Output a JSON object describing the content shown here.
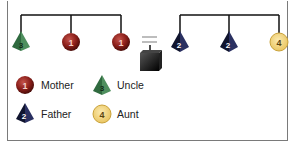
{
  "diagram": {
    "left_balance": {
      "items": [
        {
          "shape": "pyramid",
          "label": "3",
          "color": "#3f7a4e",
          "role": "Uncle"
        },
        {
          "shape": "sphere",
          "label": "1",
          "color": "#8b1f1a",
          "role": "Mother"
        },
        {
          "shape": "sphere",
          "label": "1",
          "color": "#8b1f1a",
          "role": "Mother"
        }
      ]
    },
    "middle": {
      "equals_symbol": "=",
      "weight": "black-box"
    },
    "right_balance": {
      "items": [
        {
          "shape": "pyramid",
          "label": "2",
          "color": "#1c2146",
          "role": "Father"
        },
        {
          "shape": "pyramid",
          "label": "2",
          "color": "#1c2146",
          "role": "Father"
        },
        {
          "shape": "circle",
          "label": "4",
          "color": "#f2d27a",
          "role": "Aunt"
        }
      ]
    },
    "legend": [
      {
        "icon": "sphere",
        "number": "1",
        "label": "Mother",
        "color": "#8b1f1a"
      },
      {
        "icon": "pyramid",
        "number": "3",
        "label": "Uncle",
        "color": "#3f7a4e"
      },
      {
        "icon": "pyramid",
        "number": "2",
        "label": "Father",
        "color": "#1c2146"
      },
      {
        "icon": "circle",
        "number": "4",
        "label": "Aunt",
        "color": "#f2d27a"
      }
    ]
  }
}
